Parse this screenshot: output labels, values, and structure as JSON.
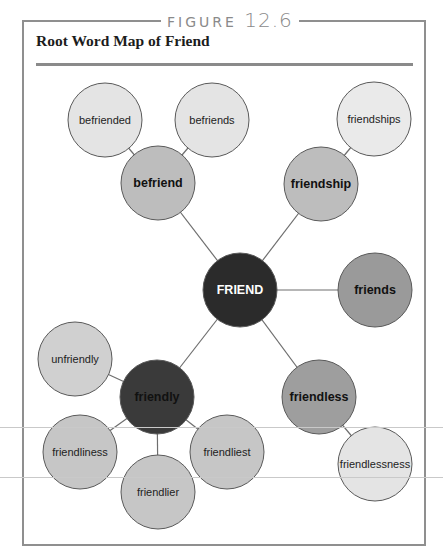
{
  "figure": {
    "label": "FIGURE",
    "number": "12.6",
    "title": "Root Word Map of Friend"
  },
  "colors": {
    "frame": "#8f8f8f",
    "root_fill": "#2b2b2b",
    "dark_derivative_fill": "#3a3a3a",
    "medium_fill": "#a6a6a6",
    "mid_light_fill": "#c8c8c8",
    "light_fill": "#e6e6e6",
    "connector": "#6e6e6e"
  },
  "diagram": {
    "root": {
      "id": "friend",
      "label": "FRIEND",
      "cx": 240,
      "cy": 290,
      "fill": "#2b2b2b",
      "text": "#ffffff",
      "bold": true
    },
    "nodes": [
      {
        "id": "befriend",
        "label": "befriend",
        "cx": 158,
        "cy": 183,
        "fill": "#bdbdbd",
        "text": "#111111",
        "bold": true,
        "parent": "friend"
      },
      {
        "id": "befriended",
        "label": "befriended",
        "cx": 105,
        "cy": 120,
        "fill": "#e4e4e4",
        "text": "#222222",
        "bold": false,
        "parent": "befriend"
      },
      {
        "id": "befriends",
        "label": "befriends",
        "cx": 212,
        "cy": 120,
        "fill": "#e4e4e4",
        "text": "#222222",
        "bold": false,
        "parent": "befriend"
      },
      {
        "id": "friendship",
        "label": "friendship",
        "cx": 321,
        "cy": 184,
        "fill": "#bdbdbd",
        "text": "#111111",
        "bold": true,
        "parent": "friend"
      },
      {
        "id": "friendships",
        "label": "friendships",
        "cx": 374,
        "cy": 119,
        "fill": "#eaeaea",
        "text": "#222222",
        "bold": false,
        "parent": "friendship"
      },
      {
        "id": "friends",
        "label": "friends",
        "cx": 375,
        "cy": 290,
        "fill": "#9a9a9a",
        "text": "#111111",
        "bold": true,
        "parent": "friend"
      },
      {
        "id": "friendly",
        "label": "friendly",
        "cx": 157,
        "cy": 397,
        "fill": "#3a3a3a",
        "text": "#111111",
        "bold": true,
        "parent": "friend"
      },
      {
        "id": "unfriendly",
        "label": "unfriendly",
        "cx": 75,
        "cy": 359,
        "fill": "#d0d0d0",
        "text": "#222222",
        "bold": false,
        "parent": "friendly"
      },
      {
        "id": "friendliness",
        "label": "friendliness",
        "cx": 80,
        "cy": 452,
        "fill": "#c6c6c6",
        "text": "#222222",
        "bold": false,
        "parent": "friendly"
      },
      {
        "id": "friendlier",
        "label": "friendlier",
        "cx": 158,
        "cy": 492,
        "fill": "#c6c6c6",
        "text": "#222222",
        "bold": false,
        "parent": "friendly"
      },
      {
        "id": "friendliest",
        "label": "friendliest",
        "cx": 227,
        "cy": 452,
        "fill": "#c6c6c6",
        "text": "#222222",
        "bold": false,
        "parent": "friendly"
      },
      {
        "id": "friendless",
        "label": "friendless",
        "cx": 319,
        "cy": 397,
        "fill": "#9e9e9e",
        "text": "#111111",
        "bold": true,
        "parent": "friend"
      },
      {
        "id": "friendlessness",
        "label": "friendlessness",
        "cx": 375,
        "cy": 464,
        "fill": "#e4e4e4",
        "text": "#222222",
        "bold": false,
        "parent": "friendless"
      }
    ],
    "radius": 37
  }
}
